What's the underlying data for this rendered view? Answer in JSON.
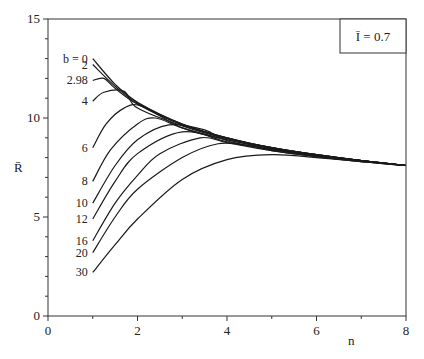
{
  "chart_data": {
    "type": "line",
    "title": "",
    "xlabel": "n",
    "ylabel": "R̄",
    "xlim": [
      0,
      8
    ],
    "ylim": [
      0,
      15
    ],
    "x_ticks": [
      0,
      2,
      4,
      6,
      8
    ],
    "y_ticks": [
      0,
      5,
      10,
      15
    ],
    "grid": false,
    "annotation": "Ī = 0.7",
    "legend_position": "top-right",
    "series": [
      {
        "name": "b = 0",
        "label": "b = 0",
        "x": [
          1,
          1.5,
          2,
          3,
          4,
          5,
          6,
          7,
          8
        ],
        "values": [
          13.0,
          11.7,
          10.8,
          9.7,
          9.0,
          8.5,
          8.15,
          7.85,
          7.6
        ]
      },
      {
        "name": "b = 2",
        "label": "2",
        "x": [
          1,
          1.5,
          2,
          3,
          4,
          5,
          6,
          7,
          8
        ],
        "values": [
          12.7,
          11.6,
          10.75,
          9.7,
          9.0,
          8.5,
          8.15,
          7.85,
          7.6
        ]
      },
      {
        "name": "b = 2.98",
        "label": "2.98",
        "x": [
          1,
          1.25,
          1.5,
          2,
          3,
          4,
          5,
          6,
          7,
          8
        ],
        "values": [
          11.9,
          12.0,
          11.5,
          10.7,
          9.65,
          9.0,
          8.5,
          8.15,
          7.85,
          7.6
        ]
      },
      {
        "name": "b = 4",
        "label": "4",
        "x": [
          1,
          1.25,
          1.7,
          2,
          3,
          4,
          5,
          6,
          7,
          8
        ],
        "values": [
          10.85,
          11.3,
          11.35,
          10.5,
          9.6,
          8.95,
          8.5,
          8.15,
          7.85,
          7.6
        ]
      },
      {
        "name": "b = 6",
        "label": "6",
        "x": [
          1,
          1.3,
          1.7,
          2.1,
          3,
          4,
          5,
          6,
          7,
          8
        ],
        "values": [
          8.5,
          9.7,
          10.5,
          10.6,
          9.5,
          8.9,
          8.45,
          8.1,
          7.85,
          7.6
        ]
      },
      {
        "name": "b = 8",
        "label": "8",
        "x": [
          1,
          1.4,
          2,
          2.4,
          3,
          4,
          5,
          6,
          7,
          8
        ],
        "values": [
          6.8,
          8.4,
          9.7,
          10.0,
          9.5,
          8.9,
          8.45,
          8.1,
          7.85,
          7.6
        ]
      },
      {
        "name": "b = 10",
        "label": "10",
        "x": [
          1,
          1.5,
          2,
          2.7,
          3.5,
          4,
          5,
          6,
          7,
          8
        ],
        "values": [
          5.7,
          7.6,
          8.9,
          9.65,
          9.4,
          8.85,
          8.4,
          8.1,
          7.85,
          7.6
        ]
      },
      {
        "name": "b = 12",
        "label": "12",
        "x": [
          1,
          1.5,
          2,
          3,
          4,
          5,
          6,
          7,
          8
        ],
        "values": [
          4.9,
          6.8,
          8.2,
          9.3,
          8.8,
          8.4,
          8.1,
          7.85,
          7.6
        ]
      },
      {
        "name": "b = 16",
        "label": "16",
        "x": [
          1,
          1.5,
          2,
          2.5,
          3.4,
          4,
          5,
          6,
          7,
          8
        ],
        "values": [
          3.8,
          5.7,
          7.1,
          8.2,
          9.0,
          8.75,
          8.35,
          8.05,
          7.8,
          7.6
        ]
      },
      {
        "name": "b = 20",
        "label": "20",
        "x": [
          1,
          1.5,
          2,
          3,
          3.8,
          4.5,
          5,
          6,
          7,
          8
        ],
        "values": [
          3.2,
          5.0,
          6.4,
          8.0,
          8.7,
          8.6,
          8.35,
          8.05,
          7.8,
          7.6
        ]
      },
      {
        "name": "b = 30",
        "label": "30",
        "x": [
          1,
          1.5,
          2,
          3,
          4,
          5,
          6,
          7,
          8
        ],
        "values": [
          2.2,
          3.6,
          4.9,
          6.9,
          7.9,
          8.15,
          8.0,
          7.8,
          7.6
        ]
      }
    ]
  }
}
